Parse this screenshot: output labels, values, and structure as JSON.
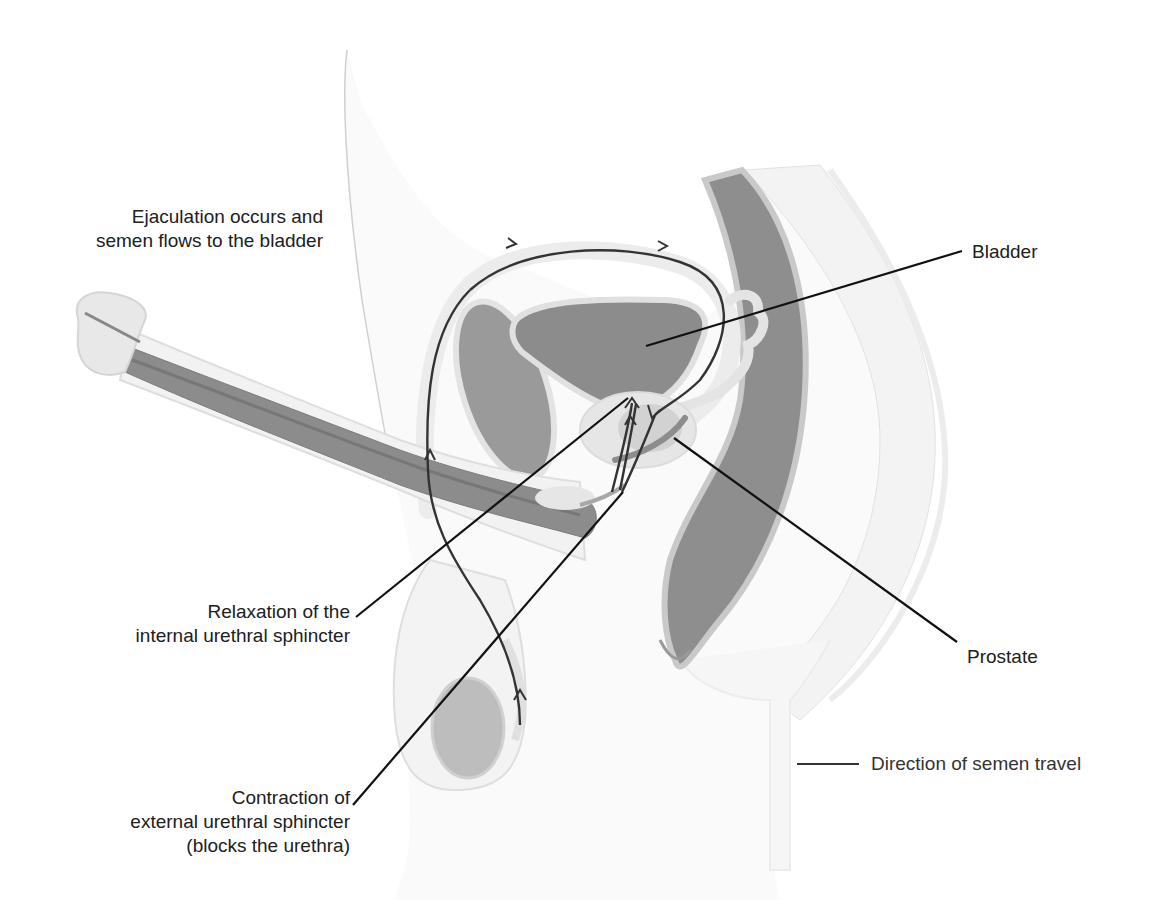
{
  "diagram": {
    "type": "anatomical-illustration",
    "labels": {
      "ejaculation": [
        "Ejaculation occurs and",
        "semen flows to the bladder"
      ],
      "bladder": "Bladder",
      "prostate": "Prostate",
      "internal_sphincter": [
        "Relaxation of the",
        "internal urethral sphincter"
      ],
      "external_sphincter": [
        "Contraction of",
        "external urethral sphincter",
        "(blocks the urethra)"
      ]
    },
    "legend": {
      "line_label": "Direction of semen travel"
    },
    "colors": {
      "organ_fill": "#8c8c8c",
      "tissue_light": "#eeeeee",
      "tissue_mid": "#d9d9d9",
      "path_line": "#333333",
      "leader_line": "#111111",
      "background": "#ffffff"
    }
  }
}
